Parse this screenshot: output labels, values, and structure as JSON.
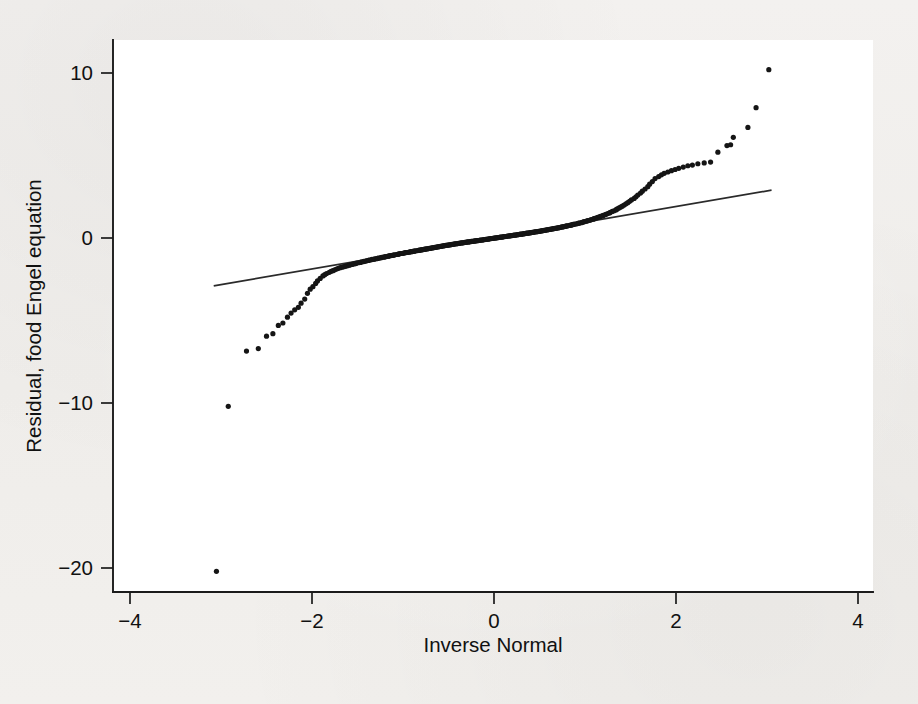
{
  "figure": {
    "background_color": "#f1efed",
    "plot_area_color": "#ffffff",
    "point_color": "#151515",
    "line_color": "#2a2a2a"
  },
  "axes": {
    "x_title": "Inverse Normal",
    "y_title": "Residual, food Engel equation",
    "x_ticks": [
      "-4",
      "-2",
      "0",
      "2",
      "4"
    ],
    "y_ticks": [
      "10",
      "0",
      "-10",
      "-20"
    ]
  },
  "chart_data": {
    "type": "scatter",
    "title": "",
    "subtitle": "",
    "xlabel": "Inverse Normal",
    "ylabel": "Residual, food Engel equation",
    "xlim": [
      -4.35,
      4.35
    ],
    "ylim": [
      -21.8,
      11.5
    ],
    "x_ticks": [
      -4,
      -2,
      0,
      2,
      4
    ],
    "y_ticks": [
      10,
      0,
      -10,
      -20
    ],
    "grid": false,
    "legend": null,
    "annotations": [],
    "series": [
      {
        "name": "Residual quantiles",
        "type": "scatter",
        "marker": "filled-circle",
        "x": [
          -3.05,
          -2.92,
          -2.72,
          -2.59,
          -2.5,
          -2.43,
          -2.37,
          -2.32,
          -2.27,
          -2.23,
          -2.19,
          -2.15,
          -2.12,
          -2.08,
          -2.05,
          -2.02,
          -1.99,
          -1.96,
          -1.94,
          -1.91,
          -1.88,
          -1.86,
          -1.84,
          -1.81,
          -1.79,
          -1.77,
          -1.75,
          -1.73,
          -1.71,
          -1.69,
          -1.67,
          -1.65,
          -1.63,
          -1.61,
          -1.59,
          -1.58,
          -1.56,
          -1.54,
          -1.52,
          -1.51,
          -1.49,
          -1.47,
          -1.46,
          -1.44,
          -1.43,
          -1.41,
          -1.4,
          -1.38,
          -1.37,
          -1.35,
          -1.34,
          -1.32,
          -1.31,
          -1.29,
          -1.28,
          -1.27,
          -1.25,
          -1.24,
          -1.23,
          -1.21,
          -1.2,
          -1.19,
          -1.17,
          -1.16,
          -1.15,
          -1.14,
          -1.12,
          -1.11,
          -1.1,
          -1.09,
          -1.07,
          -1.06,
          -1.05,
          -1.04,
          -1.03,
          -1.01,
          -1.0,
          -0.99,
          -0.98,
          -0.97,
          -0.96,
          -0.94,
          -0.93,
          -0.92,
          -0.91,
          -0.9,
          -0.89,
          -0.88,
          -0.87,
          -0.86,
          -0.84,
          -0.83,
          -0.82,
          -0.81,
          -0.8,
          -0.79,
          -0.78,
          -0.77,
          -0.76,
          -0.75,
          -0.74,
          -0.73,
          -0.72,
          -0.71,
          -0.7,
          -0.69,
          -0.68,
          -0.67,
          -0.66,
          -0.65,
          -0.64,
          -0.63,
          -0.62,
          -0.61,
          -0.6,
          -0.59,
          -0.58,
          -0.57,
          -0.56,
          -0.55,
          -0.54,
          -0.53,
          -0.52,
          -0.51,
          -0.5,
          -0.49,
          -0.48,
          -0.47,
          -0.46,
          -0.45,
          -0.44,
          -0.43,
          -0.42,
          -0.41,
          -0.4,
          -0.39,
          -0.38,
          -0.37,
          -0.36,
          -0.35,
          -0.34,
          -0.33,
          -0.32,
          -0.31,
          -0.3,
          -0.29,
          -0.28,
          -0.27,
          -0.26,
          -0.25,
          -0.24,
          -0.23,
          -0.22,
          -0.21,
          -0.2,
          -0.19,
          -0.18,
          -0.17,
          -0.16,
          -0.15,
          -0.14,
          -0.13,
          -0.12,
          -0.11,
          -0.1,
          -0.09,
          -0.08,
          -0.07,
          -0.06,
          -0.05,
          -0.04,
          -0.03,
          -0.02,
          -0.01,
          0.0,
          0.01,
          0.02,
          0.03,
          0.04,
          0.05,
          0.06,
          0.07,
          0.08,
          0.09,
          0.1,
          0.11,
          0.12,
          0.13,
          0.14,
          0.15,
          0.16,
          0.17,
          0.18,
          0.19,
          0.2,
          0.21,
          0.22,
          0.23,
          0.24,
          0.25,
          0.26,
          0.27,
          0.28,
          0.29,
          0.3,
          0.31,
          0.32,
          0.33,
          0.34,
          0.35,
          0.36,
          0.37,
          0.38,
          0.39,
          0.4,
          0.41,
          0.42,
          0.43,
          0.44,
          0.45,
          0.46,
          0.47,
          0.48,
          0.49,
          0.5,
          0.51,
          0.52,
          0.53,
          0.54,
          0.55,
          0.56,
          0.57,
          0.58,
          0.59,
          0.6,
          0.61,
          0.62,
          0.63,
          0.64,
          0.65,
          0.66,
          0.67,
          0.68,
          0.69,
          0.7,
          0.71,
          0.72,
          0.73,
          0.74,
          0.75,
          0.76,
          0.77,
          0.78,
          0.79,
          0.8,
          0.81,
          0.83,
          0.84,
          0.85,
          0.86,
          0.87,
          0.88,
          0.89,
          0.91,
          0.92,
          0.93,
          0.94,
          0.96,
          0.97,
          0.98,
          0.99,
          1.01,
          1.02,
          1.03,
          1.05,
          1.06,
          1.07,
          1.09,
          1.1,
          1.11,
          1.13,
          1.14,
          1.16,
          1.17,
          1.19,
          1.2,
          1.22,
          1.23,
          1.25,
          1.27,
          1.28,
          1.3,
          1.32,
          1.34,
          1.35,
          1.37,
          1.39,
          1.41,
          1.43,
          1.45,
          1.47,
          1.49,
          1.51,
          1.54,
          1.56,
          1.58,
          1.61,
          1.63,
          1.66,
          1.69,
          1.71,
          1.74,
          1.77,
          1.81,
          1.84,
          1.87,
          1.91,
          1.95,
          1.99,
          2.03,
          2.08,
          2.13,
          2.18,
          2.24,
          2.31,
          2.38,
          2.46,
          2.56,
          2.6,
          2.63,
          2.79,
          2.88,
          3.02
        ],
        "y": [
          -20.2,
          -10.2,
          -6.85,
          -6.7,
          -5.95,
          -5.8,
          -5.3,
          -5.15,
          -4.8,
          -4.55,
          -4.35,
          -4.2,
          -3.95,
          -3.7,
          -3.35,
          -3.1,
          -2.95,
          -2.75,
          -2.6,
          -2.45,
          -2.3,
          -2.22,
          -2.15,
          -2.08,
          -2.02,
          -1.98,
          -1.93,
          -1.88,
          -1.84,
          -1.8,
          -1.77,
          -1.74,
          -1.71,
          -1.68,
          -1.65,
          -1.62,
          -1.6,
          -1.57,
          -1.55,
          -1.52,
          -1.5,
          -1.48,
          -1.46,
          -1.44,
          -1.42,
          -1.4,
          -1.38,
          -1.36,
          -1.34,
          -1.32,
          -1.3,
          -1.29,
          -1.27,
          -1.25,
          -1.24,
          -1.22,
          -1.2,
          -1.19,
          -1.17,
          -1.16,
          -1.14,
          -1.13,
          -1.11,
          -1.1,
          -1.08,
          -1.07,
          -1.06,
          -1.04,
          -1.03,
          -1.02,
          -1.0,
          -0.99,
          -0.98,
          -0.96,
          -0.95,
          -0.94,
          -0.93,
          -0.91,
          -0.9,
          -0.89,
          -0.88,
          -0.87,
          -0.85,
          -0.84,
          -0.83,
          -0.82,
          -0.81,
          -0.8,
          -0.79,
          -0.78,
          -0.76,
          -0.75,
          -0.74,
          -0.73,
          -0.72,
          -0.71,
          -0.7,
          -0.69,
          -0.68,
          -0.67,
          -0.66,
          -0.65,
          -0.64,
          -0.63,
          -0.62,
          -0.61,
          -0.6,
          -0.59,
          -0.58,
          -0.57,
          -0.56,
          -0.55,
          -0.54,
          -0.53,
          -0.52,
          -0.51,
          -0.5,
          -0.49,
          -0.48,
          -0.47,
          -0.46,
          -0.45,
          -0.44,
          -0.43,
          -0.43,
          -0.42,
          -0.41,
          -0.4,
          -0.39,
          -0.38,
          -0.37,
          -0.36,
          -0.35,
          -0.35,
          -0.34,
          -0.33,
          -0.32,
          -0.31,
          -0.3,
          -0.29,
          -0.29,
          -0.28,
          -0.27,
          -0.26,
          -0.25,
          -0.24,
          -0.24,
          -0.23,
          -0.22,
          -0.21,
          -0.2,
          -0.2,
          -0.19,
          -0.18,
          -0.17,
          -0.16,
          -0.16,
          -0.15,
          -0.14,
          -0.13,
          -0.12,
          -0.12,
          -0.11,
          -0.1,
          -0.09,
          -0.08,
          -0.08,
          -0.07,
          -0.06,
          -0.05,
          -0.04,
          -0.03,
          -0.03,
          -0.02,
          -0.01,
          0.0,
          0.01,
          0.01,
          0.02,
          0.03,
          0.04,
          0.05,
          0.05,
          0.06,
          0.07,
          0.08,
          0.09,
          0.09,
          0.1,
          0.11,
          0.12,
          0.13,
          0.13,
          0.14,
          0.15,
          0.16,
          0.17,
          0.18,
          0.18,
          0.19,
          0.2,
          0.21,
          0.22,
          0.23,
          0.23,
          0.24,
          0.25,
          0.26,
          0.27,
          0.28,
          0.29,
          0.29,
          0.3,
          0.31,
          0.32,
          0.33,
          0.34,
          0.35,
          0.36,
          0.37,
          0.38,
          0.38,
          0.39,
          0.4,
          0.41,
          0.42,
          0.43,
          0.44,
          0.45,
          0.46,
          0.47,
          0.48,
          0.49,
          0.5,
          0.51,
          0.52,
          0.53,
          0.54,
          0.55,
          0.56,
          0.57,
          0.58,
          0.59,
          0.6,
          0.61,
          0.62,
          0.63,
          0.65,
          0.66,
          0.67,
          0.68,
          0.69,
          0.7,
          0.72,
          0.73,
          0.74,
          0.76,
          0.77,
          0.79,
          0.8,
          0.82,
          0.83,
          0.85,
          0.86,
          0.88,
          0.9,
          0.91,
          0.93,
          0.95,
          0.97,
          0.99,
          1.01,
          1.03,
          1.05,
          1.07,
          1.09,
          1.12,
          1.14,
          1.17,
          1.19,
          1.22,
          1.25,
          1.28,
          1.31,
          1.34,
          1.37,
          1.41,
          1.44,
          1.48,
          1.52,
          1.56,
          1.61,
          1.65,
          1.7,
          1.75,
          1.81,
          1.87,
          1.93,
          2.0,
          2.07,
          2.14,
          2.22,
          2.31,
          2.4,
          2.5,
          2.6,
          2.72,
          2.84,
          2.97,
          3.11,
          3.26,
          3.42,
          3.6,
          3.72,
          3.83,
          3.92,
          4.0,
          4.08,
          4.15,
          4.22,
          4.3,
          4.38,
          4.42,
          4.5,
          4.55,
          4.6,
          5.2,
          5.6,
          5.65,
          6.1,
          6.7,
          7.9,
          10.2
        ]
      },
      {
        "name": "reference line",
        "type": "line",
        "x": [
          -3.08,
          3.05
        ],
        "y": [
          -2.9,
          2.9
        ]
      }
    ]
  }
}
